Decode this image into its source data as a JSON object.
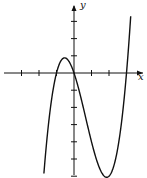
{
  "chart_data": {
    "type": "line",
    "title": "",
    "xlabel": "x",
    "ylabel": "y",
    "function": "y = x(x+1)(x-3)",
    "x_ticks": [
      -3,
      -2,
      -1,
      1,
      2,
      3
    ],
    "y_ticks": [
      -6,
      -5,
      -4,
      -3,
      -2,
      -1,
      1,
      2,
      3
    ],
    "xlim": [
      -4,
      4
    ],
    "ylim": [
      -6.5,
      4
    ],
    "grid": false,
    "x_intercepts": [
      -1,
      0,
      3
    ],
    "local_max": {
      "x": -0.54,
      "y": 0.88
    },
    "local_min": {
      "x": 1.87,
      "y": -6.07
    }
  },
  "labels": {
    "x_axis": "x",
    "y_axis": "y"
  }
}
